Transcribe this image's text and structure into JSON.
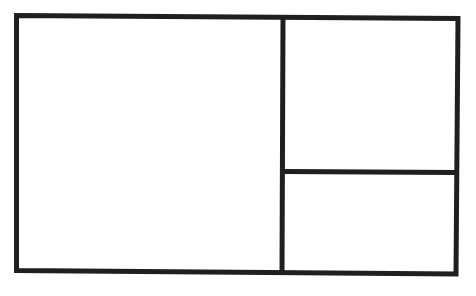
{
  "diagram": {
    "type": "layout-wireframe",
    "stroke_color": "#1f1f1f",
    "background": "#ffffff",
    "panels": [
      {
        "name": "left-panel",
        "label": ""
      },
      {
        "name": "top-right-panel",
        "label": ""
      },
      {
        "name": "bottom-right-panel",
        "label": ""
      }
    ]
  }
}
